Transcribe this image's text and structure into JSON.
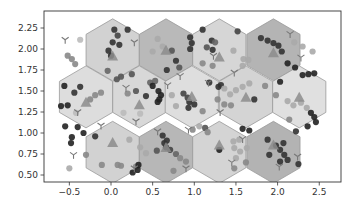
{
  "chart_data": {
    "type": "scatter",
    "title": "",
    "xlabel": "",
    "ylabel": "",
    "xlim": [
      -0.8,
      2.77
    ],
    "ylim": [
      0.42,
      2.45
    ],
    "grid": false,
    "legend": null,
    "xticks": [
      -0.5,
      0.0,
      0.5,
      1.0,
      1.5,
      2.0,
      2.5
    ],
    "xtick_labels": [
      "−0.5",
      "0.0",
      "0.5",
      "1.0",
      "1.5",
      "2.0",
      "2.5"
    ],
    "yticks": [
      0.5,
      0.75,
      1.0,
      1.25,
      1.5,
      1.75,
      2.0,
      2.25
    ],
    "ytick_labels": [
      "0.50",
      "0.75",
      "1.00",
      "1.25",
      "1.50",
      "1.75",
      "2.00",
      "2.25"
    ],
    "hexagons": [
      {
        "x": 0.02,
        "y": 1.99,
        "shade": "#d2d2d2"
      },
      {
        "x": 0.66,
        "y": 1.99,
        "shade": "#b9b9b9"
      },
      {
        "x": 1.3,
        "y": 1.99,
        "shade": "#d6d6d6"
      },
      {
        "x": 1.95,
        "y": 1.99,
        "shade": "#b4b4b4"
      },
      {
        "x": -0.3,
        "y": 1.43,
        "shade": "#dddddd"
      },
      {
        "x": 0.34,
        "y": 1.43,
        "shade": "#d8d8d8"
      },
      {
        "x": 0.97,
        "y": 1.43,
        "shade": "#dedede"
      },
      {
        "x": 1.62,
        "y": 1.43,
        "shade": "#d4d4d4"
      },
      {
        "x": 2.26,
        "y": 1.43,
        "shade": "#e0e0e0"
      },
      {
        "x": 0.02,
        "y": 0.77,
        "shade": "#d2d2d2"
      },
      {
        "x": 0.66,
        "y": 0.77,
        "shade": "#b7b7b7"
      },
      {
        "x": 1.3,
        "y": 0.77,
        "shade": "#d4d4d4"
      },
      {
        "x": 1.95,
        "y": 0.77,
        "shade": "#b3b3b3"
      }
    ],
    "centroids": [
      {
        "x": 0.02,
        "y": 1.91
      },
      {
        "x": 0.66,
        "y": 1.98
      },
      {
        "x": 1.3,
        "y": 1.9
      },
      {
        "x": 1.95,
        "y": 1.95
      },
      {
        "x": -0.3,
        "y": 1.36
      },
      {
        "x": 0.34,
        "y": 1.33
      },
      {
        "x": 0.97,
        "y": 1.43
      },
      {
        "x": 1.62,
        "y": 1.42
      },
      {
        "x": 2.26,
        "y": 1.42
      },
      {
        "x": 0.02,
        "y": 0.88
      },
      {
        "x": 0.66,
        "y": 0.82
      },
      {
        "x": 1.3,
        "y": 0.85
      },
      {
        "x": 1.95,
        "y": 0.85
      }
    ],
    "y_markers": [
      {
        "x": -0.55,
        "y": 2.11
      },
      {
        "x": 0.28,
        "y": 2.08
      },
      {
        "x": 0.83,
        "y": 1.68
      },
      {
        "x": 1.23,
        "y": 1.92
      },
      {
        "x": 1.48,
        "y": 1.72
      },
      {
        "x": 2.15,
        "y": 2.18
      },
      {
        "x": 2.28,
        "y": 1.9
      },
      {
        "x": 0.18,
        "y": 1.54
      },
      {
        "x": 0.68,
        "y": 1.57
      },
      {
        "x": 1.17,
        "y": 1.6
      },
      {
        "x": 1.31,
        "y": 1.25
      },
      {
        "x": -0.4,
        "y": 1.25
      },
      {
        "x": -0.12,
        "y": 1.09
      },
      {
        "x": 0.3,
        "y": 1.14
      },
      {
        "x": 0.56,
        "y": 1.02
      },
      {
        "x": -0.45,
        "y": 0.74
      },
      {
        "x": 0.28,
        "y": 0.58
      },
      {
        "x": 0.93,
        "y": 1.04
      },
      {
        "x": 1.58,
        "y": 0.93
      },
      {
        "x": 1.45,
        "y": 0.65
      },
      {
        "x": 2.24,
        "y": 0.72
      },
      {
        "x": 2.02,
        "y": 0.6
      },
      {
        "x": 0.9,
        "y": 0.58
      }
    ],
    "points": [
      {
        "x": -0.52,
        "y": 1.92,
        "c": "#888888"
      },
      {
        "x": -0.47,
        "y": 1.88,
        "c": "#888888"
      },
      {
        "x": -0.43,
        "y": 1.82,
        "c": "#888888"
      },
      {
        "x": 0.04,
        "y": 2.23,
        "c": "#333333"
      },
      {
        "x": 0.08,
        "y": 2.16,
        "c": "#444444"
      },
      {
        "x": 0.02,
        "y": 2.08,
        "c": "#333333"
      },
      {
        "x": 0.1,
        "y": 2.05,
        "c": "#333333"
      },
      {
        "x": -0.03,
        "y": 1.98,
        "c": "#333333"
      },
      {
        "x": 0.0,
        "y": 1.92,
        "c": "#333333"
      },
      {
        "x": 0.2,
        "y": 2.23,
        "c": "#333333"
      },
      {
        "x": -0.37,
        "y": 2.11,
        "c": "#bbbbbb"
      },
      {
        "x": -0.04,
        "y": 1.74,
        "c": "#666666"
      },
      {
        "x": 0.56,
        "y": 2.12,
        "c": "#aaaaaa"
      },
      {
        "x": 0.62,
        "y": 2.03,
        "c": "#aaaaaa"
      },
      {
        "x": 0.5,
        "y": 1.97,
        "c": "#aaaaaa"
      },
      {
        "x": 0.73,
        "y": 1.98,
        "c": "#555555"
      },
      {
        "x": 0.78,
        "y": 1.86,
        "c": "#333333"
      },
      {
        "x": 0.82,
        "y": 1.78,
        "c": "#555555"
      },
      {
        "x": 0.67,
        "y": 1.75,
        "c": "#333333"
      },
      {
        "x": 0.53,
        "y": 1.62,
        "c": "#666666"
      },
      {
        "x": 0.47,
        "y": 1.6,
        "c": "#666666"
      },
      {
        "x": 0.95,
        "y": 2.14,
        "c": "#333333"
      },
      {
        "x": 0.97,
        "y": 2.07,
        "c": "#333333"
      },
      {
        "x": 0.95,
        "y": 2.0,
        "c": "#333333"
      },
      {
        "x": 1.1,
        "y": 2.23,
        "c": "#333333"
      },
      {
        "x": 1.21,
        "y": 2.1,
        "c": "#333333"
      },
      {
        "x": 1.15,
        "y": 2.02,
        "c": "#555555"
      },
      {
        "x": 1.25,
        "y": 2.08,
        "c": "#666666"
      },
      {
        "x": 1.22,
        "y": 1.99,
        "c": "#333333"
      },
      {
        "x": 1.22,
        "y": 1.8,
        "c": "#888888"
      },
      {
        "x": 1.1,
        "y": 1.83,
        "c": "#888888"
      },
      {
        "x": 1.52,
        "y": 2.21,
        "c": "#444444"
      },
      {
        "x": 1.47,
        "y": 1.98,
        "c": "#aaaaaa"
      },
      {
        "x": 1.59,
        "y": 1.88,
        "c": "#aaaaaa"
      },
      {
        "x": 1.65,
        "y": 1.87,
        "c": "#aaaaaa"
      },
      {
        "x": 1.58,
        "y": 1.8,
        "c": "#aaaaaa"
      },
      {
        "x": 1.8,
        "y": 2.13,
        "c": "#333333"
      },
      {
        "x": 1.88,
        "y": 2.1,
        "c": "#333333"
      },
      {
        "x": 1.95,
        "y": 2.07,
        "c": "#333333"
      },
      {
        "x": 2.01,
        "y": 2.04,
        "c": "#333333"
      },
      {
        "x": 2.05,
        "y": 1.97,
        "c": "#333333"
      },
      {
        "x": 2.12,
        "y": 1.83,
        "c": "#222222"
      },
      {
        "x": 2.21,
        "y": 1.78,
        "c": "#222222"
      },
      {
        "x": 2.2,
        "y": 2.08,
        "c": "#aaaaaa"
      },
      {
        "x": 2.3,
        "y": 2.03,
        "c": "#aaaaaa"
      },
      {
        "x": 2.42,
        "y": 1.97,
        "c": "#aaaaaa"
      },
      {
        "x": 2.3,
        "y": 1.69,
        "c": "#222222"
      },
      {
        "x": 2.37,
        "y": 1.7,
        "c": "#222222"
      },
      {
        "x": 2.44,
        "y": 1.71,
        "c": "#222222"
      },
      {
        "x": -0.56,
        "y": 1.56,
        "c": "#222222"
      },
      {
        "x": -0.44,
        "y": 1.48,
        "c": "#333333"
      },
      {
        "x": -0.37,
        "y": 1.55,
        "c": "#333333"
      },
      {
        "x": -0.19,
        "y": 1.45,
        "c": "#888888"
      },
      {
        "x": -0.12,
        "y": 1.48,
        "c": "#888888"
      },
      {
        "x": -0.25,
        "y": 1.4,
        "c": "#888888"
      },
      {
        "x": -0.6,
        "y": 1.32,
        "c": "#222222"
      },
      {
        "x": -0.52,
        "y": 1.33,
        "c": "#222222"
      },
      {
        "x": -0.42,
        "y": 1.24,
        "c": "#bbbbbb"
      },
      {
        "x": 0.07,
        "y": 1.64,
        "c": "#555555"
      },
      {
        "x": 0.12,
        "y": 1.67,
        "c": "#555555"
      },
      {
        "x": 0.25,
        "y": 1.7,
        "c": "#555555"
      },
      {
        "x": 0.3,
        "y": 1.5,
        "c": "#555555"
      },
      {
        "x": 0.2,
        "y": 1.47,
        "c": "#888888"
      },
      {
        "x": 0.42,
        "y": 1.44,
        "c": "#333333"
      },
      {
        "x": 0.5,
        "y": 1.56,
        "c": "#222222"
      },
      {
        "x": 0.57,
        "y": 1.5,
        "c": "#222222"
      },
      {
        "x": 0.6,
        "y": 1.45,
        "c": "#222222"
      },
      {
        "x": 0.58,
        "y": 1.4,
        "c": "#222222"
      },
      {
        "x": 0.56,
        "y": 1.37,
        "c": "#222222"
      },
      {
        "x": 0.35,
        "y": 1.23,
        "c": "#bbbbbb"
      },
      {
        "x": 0.15,
        "y": 1.24,
        "c": "#bbbbbb"
      },
      {
        "x": 0.73,
        "y": 1.45,
        "c": "#aaaaaa"
      },
      {
        "x": 0.78,
        "y": 1.32,
        "c": "#aaaaaa"
      },
      {
        "x": 0.87,
        "y": 1.47,
        "c": "#444444"
      },
      {
        "x": 0.92,
        "y": 1.42,
        "c": "#444444"
      },
      {
        "x": 0.93,
        "y": 1.3,
        "c": "#333333"
      },
      {
        "x": 1.0,
        "y": 1.34,
        "c": "#333333"
      },
      {
        "x": 0.94,
        "y": 1.37,
        "c": "#333333"
      },
      {
        "x": 1.1,
        "y": 1.26,
        "c": "#888888"
      },
      {
        "x": 1.18,
        "y": 1.6,
        "c": "#333333"
      },
      {
        "x": 1.29,
        "y": 1.55,
        "c": "#333333"
      },
      {
        "x": 1.32,
        "y": 1.57,
        "c": "#333333"
      },
      {
        "x": 1.36,
        "y": 1.53,
        "c": "#aaaaaa"
      },
      {
        "x": 1.28,
        "y": 1.4,
        "c": "#888888"
      },
      {
        "x": 1.43,
        "y": 1.46,
        "c": "#aaaaaa"
      },
      {
        "x": 1.5,
        "y": 1.51,
        "c": "#aaaaaa"
      },
      {
        "x": 1.58,
        "y": 1.55,
        "c": "#aaaaaa"
      },
      {
        "x": 1.36,
        "y": 1.34,
        "c": "#888888"
      },
      {
        "x": 1.44,
        "y": 1.33,
        "c": "#888888"
      },
      {
        "x": 1.66,
        "y": 1.59,
        "c": "#aaaaaa"
      },
      {
        "x": 1.72,
        "y": 1.4,
        "c": "#333333"
      },
      {
        "x": 1.85,
        "y": 1.56,
        "c": "#888888"
      },
      {
        "x": 1.98,
        "y": 1.45,
        "c": "#888888"
      },
      {
        "x": 2.03,
        "y": 1.61,
        "c": "#222222"
      },
      {
        "x": 2.12,
        "y": 1.38,
        "c": "#aaaaaa"
      },
      {
        "x": 2.19,
        "y": 1.33,
        "c": "#aaaaaa"
      },
      {
        "x": 2.28,
        "y": 1.36,
        "c": "#aaaaaa"
      },
      {
        "x": 2.35,
        "y": 1.3,
        "c": "#aaaaaa"
      },
      {
        "x": 2.4,
        "y": 1.24,
        "c": "#222222"
      },
      {
        "x": 2.44,
        "y": 1.19,
        "c": "#222222"
      },
      {
        "x": 2.46,
        "y": 1.13,
        "c": "#222222"
      },
      {
        "x": 2.36,
        "y": 1.08,
        "c": "#222222"
      },
      {
        "x": 2.14,
        "y": 1.16,
        "c": "#888888"
      },
      {
        "x": -0.55,
        "y": 1.08,
        "c": "#222222"
      },
      {
        "x": -0.4,
        "y": 1.07,
        "c": "#222222"
      },
      {
        "x": -0.33,
        "y": 1.0,
        "c": "#222222"
      },
      {
        "x": -0.47,
        "y": 0.95,
        "c": "#222222"
      },
      {
        "x": -0.48,
        "y": 0.88,
        "c": "#222222"
      },
      {
        "x": -0.19,
        "y": 0.96,
        "c": "#333333"
      },
      {
        "x": -0.3,
        "y": 0.74,
        "c": "#888888"
      },
      {
        "x": -0.5,
        "y": 0.58,
        "c": "#aaaaaa"
      },
      {
        "x": 0.22,
        "y": 0.92,
        "c": "#aaaaaa"
      },
      {
        "x": 0.35,
        "y": 0.83,
        "c": "#aaaaaa"
      },
      {
        "x": 0.42,
        "y": 0.76,
        "c": "#aaaaaa"
      },
      {
        "x": 0.3,
        "y": 0.6,
        "c": "#888888"
      },
      {
        "x": -0.11,
        "y": 0.62,
        "c": "#888888"
      },
      {
        "x": 0.08,
        "y": 0.62,
        "c": "#888888"
      },
      {
        "x": 0.12,
        "y": 0.61,
        "c": "#888888"
      },
      {
        "x": 0.26,
        "y": 0.53,
        "c": "#222222"
      },
      {
        "x": 0.32,
        "y": 0.56,
        "c": "#222222"
      },
      {
        "x": 0.33,
        "y": 0.62,
        "c": "#222222"
      },
      {
        "x": 0.62,
        "y": 0.97,
        "c": "#333333"
      },
      {
        "x": 0.64,
        "y": 0.88,
        "c": "#333333"
      },
      {
        "x": 0.66,
        "y": 0.83,
        "c": "#333333"
      },
      {
        "x": 0.71,
        "y": 0.8,
        "c": "#444444"
      },
      {
        "x": 0.67,
        "y": 0.91,
        "c": "#333333"
      },
      {
        "x": 0.55,
        "y": 0.79,
        "c": "#555555"
      },
      {
        "x": 0.78,
        "y": 0.75,
        "c": "#666666"
      },
      {
        "x": 0.83,
        "y": 0.7,
        "c": "#888888"
      },
      {
        "x": 0.9,
        "y": 0.66,
        "c": "#888888"
      },
      {
        "x": 0.75,
        "y": 0.55,
        "c": "#888888"
      },
      {
        "x": 0.98,
        "y": 1.04,
        "c": "#888888"
      },
      {
        "x": 1.06,
        "y": 1.08,
        "c": "#aaaaaa"
      },
      {
        "x": 1.13,
        "y": 1.06,
        "c": "#555555"
      },
      {
        "x": 1.16,
        "y": 1.01,
        "c": "#888888"
      },
      {
        "x": 1.3,
        "y": 0.8,
        "c": "#222222"
      },
      {
        "x": 1.47,
        "y": 0.9,
        "c": "#aaaaaa"
      },
      {
        "x": 1.54,
        "y": 0.92,
        "c": "#aaaaaa"
      },
      {
        "x": 1.48,
        "y": 0.82,
        "c": "#aaaaaa"
      },
      {
        "x": 1.55,
        "y": 0.78,
        "c": "#aaaaaa"
      },
      {
        "x": 1.63,
        "y": 0.82,
        "c": "#aaaaaa"
      },
      {
        "x": 1.5,
        "y": 0.7,
        "c": "#aaaaaa"
      },
      {
        "x": 1.48,
        "y": 0.58,
        "c": "#888888"
      },
      {
        "x": 1.62,
        "y": 0.65,
        "c": "#888888"
      },
      {
        "x": 1.58,
        "y": 1.05,
        "c": "#222222"
      },
      {
        "x": 1.66,
        "y": 1.03,
        "c": "#222222"
      },
      {
        "x": 1.88,
        "y": 0.92,
        "c": "#333333"
      },
      {
        "x": 1.98,
        "y": 0.85,
        "c": "#333333"
      },
      {
        "x": 2.07,
        "y": 0.88,
        "c": "#333333"
      },
      {
        "x": 2.03,
        "y": 0.8,
        "c": "#333333"
      },
      {
        "x": 2.08,
        "y": 0.74,
        "c": "#333333"
      },
      {
        "x": 1.9,
        "y": 0.74,
        "c": "#333333"
      },
      {
        "x": 2.12,
        "y": 0.68,
        "c": "#333333"
      },
      {
        "x": 2.03,
        "y": 0.66,
        "c": "#333333"
      },
      {
        "x": 2.25,
        "y": 0.63,
        "c": "#333333"
      },
      {
        "x": 2.22,
        "y": 1.02,
        "c": "#333333"
      }
    ]
  }
}
